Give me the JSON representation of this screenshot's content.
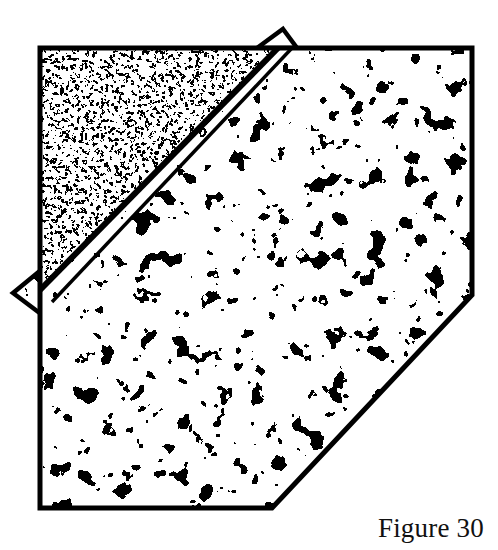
{
  "figure": {
    "caption": "Figure 30",
    "title": "Figure 30",
    "background_color": "#ffffff",
    "ink_color": "#000000",
    "outline_color": "#000000",
    "outline_width_px": 4,
    "fold_line_color": "#000000",
    "regions": [
      {
        "id": "folded-flap",
        "name": "upper-left folded flap",
        "texture": "fine-labyrinth-stipple",
        "texture_scale": "fine",
        "density_percent": 52,
        "tone": "dark",
        "fill_color": "#000000"
      },
      {
        "id": "main-face",
        "name": "main sheet face",
        "texture": "coarse-blob-stipple",
        "texture_scale": "coarse",
        "density_percent": 26,
        "tone": "light",
        "fill_color": "#000000"
      },
      {
        "id": "top-tab",
        "name": "top triangular tab",
        "texture": "coarse-blob-stipple",
        "tone": "light",
        "fill_color": "#000000"
      },
      {
        "id": "left-tab",
        "name": "left triangular tab",
        "texture": "coarse-blob-stipple",
        "tone": "light",
        "fill_color": "#000000"
      }
    ],
    "geometry": {
      "sheet_outline": "40,48 472,48 472,295 272,508 40,508",
      "fold_triangle": "40,48 278,48 40,290",
      "fold_line": "278,48 40,290",
      "fold_under_edge": "290,48 52,300",
      "top_tab": "283,29 258,48 296,48",
      "left_tab": "13,293 40,271 40,313",
      "bottom_right_cut": "472,295 272,508"
    }
  }
}
